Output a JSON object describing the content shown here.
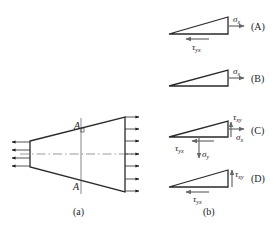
{
  "figure_a": {
    "section_label_top": "A",
    "section_label_bottom": "A",
    "caption": "(a)"
  },
  "figure_b": {
    "caption": "(b)",
    "options": [
      {
        "label": "(A)",
        "sigma_x": "σ",
        "sigma_x_sub": "x",
        "tau_yx": "τ",
        "tau_yx_sub": "yx"
      },
      {
        "label": "(B)",
        "sigma_x": "σ",
        "sigma_x_sub": "x"
      },
      {
        "label": "(C)",
        "tau_xy": "τ",
        "tau_xy_sub": "xy",
        "sigma_x": "σ",
        "sigma_x_sub": "x",
        "tau_yx": "τ",
        "tau_yx_sub": "yx",
        "sigma_y": "σ",
        "sigma_y_sub": "y"
      },
      {
        "label": "(D)",
        "tau_xy": "τ",
        "tau_xy_sub": "xy",
        "tau_yx": "τ",
        "tau_yx_sub": "yx"
      }
    ]
  },
  "colors": {
    "line": "#2a2a2a",
    "arrow": "#6a6a6a"
  }
}
